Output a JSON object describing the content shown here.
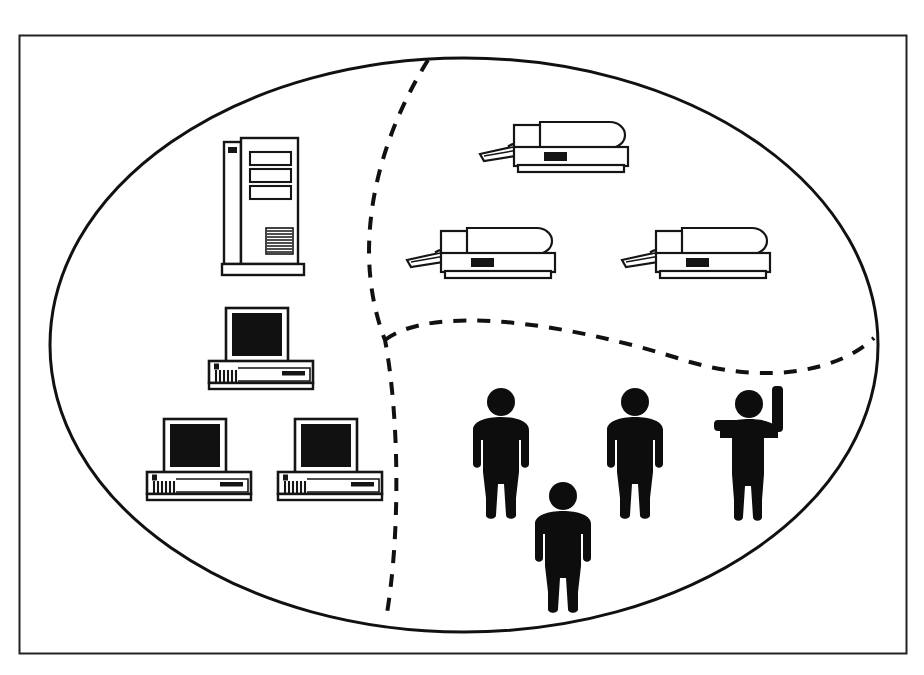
{
  "canvas": {
    "width": 924,
    "height": 675,
    "background": "#ffffff",
    "ink": "#000000",
    "line_color": "#1a1a1a"
  },
  "frame": {
    "name": "outer-border",
    "x": 19,
    "y": 35,
    "width": 887,
    "height": 618,
    "stroke_width": 2
  },
  "diagram": {
    "type": "venn-resource-grouping",
    "ellipse": {
      "cx": 464,
      "cy": 345,
      "rx": 414,
      "ry": 287,
      "stroke_width": 3
    },
    "dividers": [
      {
        "name": "vertical-dashed-divider",
        "description": "dashed curve from top of ellipse down to bottom of ellipse, separating computers from printers and people",
        "path": "M 428 60 C 372 150 352 255 385 340 C 400 420 400 540 386 619",
        "dash": "13 11",
        "stroke_width": 4
      },
      {
        "name": "horizontal-dashed-divider",
        "description": "dashed curve from the vertical divider across to the right edge of the ellipse, separating printers from people",
        "path": "M 385 340 C 430 305 560 320 690 362 C 770 385 840 370 874 338",
        "dash": "13 11",
        "stroke_width": 4
      }
    ]
  },
  "devices": {
    "server": {
      "label": "mainframe-server-tower",
      "count": 1,
      "x": 222,
      "y": 138,
      "width": 82,
      "height": 140
    },
    "workstations": {
      "label": "desktop-computer",
      "count": 3,
      "items": [
        {
          "x": 208,
          "y": 308,
          "width": 108,
          "height": 82
        },
        {
          "x": 146,
          "y": 419,
          "width": 108,
          "height": 82
        },
        {
          "x": 277,
          "y": 419,
          "width": 108,
          "height": 82
        }
      ]
    },
    "printers": {
      "label": "laser-printer",
      "count": 3,
      "items": [
        {
          "x": 478,
          "y": 118,
          "width": 160,
          "height": 56
        },
        {
          "x": 405,
          "y": 224,
          "width": 160,
          "height": 56
        },
        {
          "x": 620,
          "y": 224,
          "width": 160,
          "height": 56
        }
      ]
    }
  },
  "people": {
    "label": "person-pictogram",
    "count": 4,
    "items": [
      {
        "name": "person-standing-1",
        "x": 472,
        "y": 388,
        "scale": 1.0,
        "pose": "arms-down"
      },
      {
        "name": "person-standing-2",
        "x": 606,
        "y": 388,
        "scale": 1.0,
        "pose": "arms-down"
      },
      {
        "name": "person-arm-raised",
        "x": 716,
        "y": 386,
        "scale": 1.0,
        "pose": "one-arm-up-one-arm-out"
      },
      {
        "name": "person-standing-3",
        "x": 534,
        "y": 482,
        "scale": 1.0,
        "pose": "arms-down"
      }
    ]
  },
  "groups": [
    {
      "name": "group-computers",
      "contents": "1 server tower, 3 desktop computers"
    },
    {
      "name": "group-printers",
      "contents": "3 laser printers"
    },
    {
      "name": "group-users",
      "contents": "4 people"
    }
  ]
}
